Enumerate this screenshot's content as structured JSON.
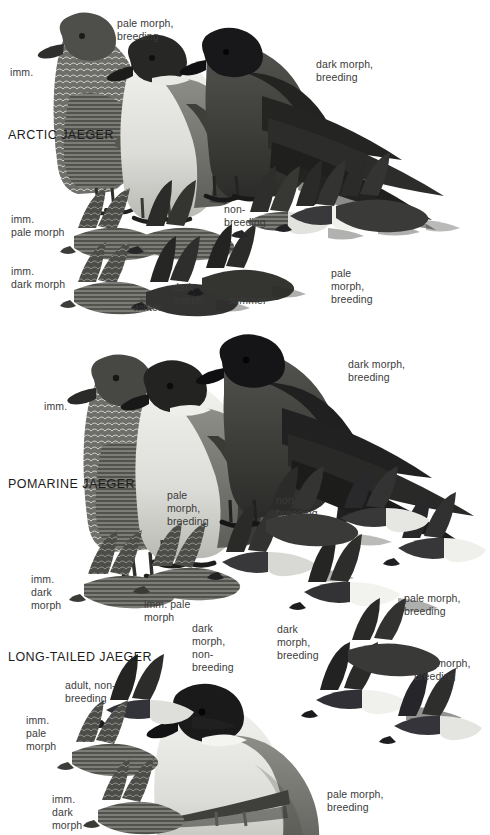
{
  "page": {
    "background": "#ffffff",
    "width": 490,
    "height": 835,
    "text_color": "#3b3b3b",
    "heading_color": "#1c1c1c"
  },
  "sections": [
    {
      "id": "arctic",
      "heading": "ARCTIC JAEGER",
      "heading_pos": {
        "x": 8,
        "y": 128
      },
      "labels": [
        {
          "name": "imm",
          "text": "imm.",
          "x": 10,
          "y": 66
        },
        {
          "name": "pale-morph-breeding",
          "text": "pale morph,\nbreeding",
          "x": 117,
          "y": 17
        },
        {
          "name": "dark-morph-breeding",
          "text": "dark morph,\nbreeding",
          "x": 316,
          "y": 58
        },
        {
          "name": "imm-pale-morph",
          "text": "imm.\npale morph",
          "x": 11,
          "y": 213
        },
        {
          "name": "imm-dark-morph",
          "text": "imm.\ndark morph",
          "x": 11,
          "y": 265
        },
        {
          "name": "winter",
          "text": "winter",
          "x": 133,
          "y": 301
        },
        {
          "name": "dark-morph",
          "text": "dark\nmorph",
          "x": 173,
          "y": 281
        },
        {
          "name": "summer",
          "text": "summer",
          "x": 228,
          "y": 294
        },
        {
          "name": "non-breeding",
          "text": "non-\nbreeding",
          "x": 224,
          "y": 203
        },
        {
          "name": "pale-morph-breeding-flight",
          "text": "pale\nmorph,\nbreeding",
          "x": 331,
          "y": 267
        }
      ]
    },
    {
      "id": "pomarine",
      "heading": "POMARINE JAEGER",
      "heading_pos": {
        "x": 8,
        "y": 477
      },
      "labels": [
        {
          "name": "imm",
          "text": "imm.",
          "x": 44,
          "y": 400
        },
        {
          "name": "pale-morph-breeding",
          "text": "pale\nmorph,\nbreeding",
          "x": 167,
          "y": 489
        },
        {
          "name": "dark-morph-breeding",
          "text": "dark morph,\nbreeding",
          "x": 348,
          "y": 358
        },
        {
          "name": "non-breeding",
          "text": "non-\nbreeding",
          "x": 276,
          "y": 494
        },
        {
          "name": "imm-dark-morph",
          "text": "imm.\ndark\nmorph",
          "x": 31,
          "y": 573
        },
        {
          "name": "imm-pale-morph",
          "text": "imm. pale\nmorph",
          "x": 144,
          "y": 598
        },
        {
          "name": "dark-morph-non-breeding",
          "text": "dark\nmorph,\nnon-\nbreeding",
          "x": 192,
          "y": 622
        },
        {
          "name": "dark-morph-breeding-flight",
          "text": "dark\nmorph,\nbreeding",
          "x": 277,
          "y": 623
        },
        {
          "name": "pale-morph-breeding-flight",
          "text": "pale morph,\nbreeding",
          "x": 404,
          "y": 592
        }
      ]
    },
    {
      "id": "long-tailed",
      "heading": "LONG-TAILED JAEGER",
      "heading_pos": {
        "x": 8,
        "y": 650
      },
      "labels": [
        {
          "name": "adult-non-breeding",
          "text": "adult, non-\nbreeding",
          "x": 65,
          "y": 679
        },
        {
          "name": "imm-pale-morph",
          "text": "imm.\npale\nmorph",
          "x": 26,
          "y": 714
        },
        {
          "name": "imm-dark-morph",
          "text": "imm.\ndark\nmorph",
          "x": 52,
          "y": 793
        },
        {
          "name": "pale-morph-breeding-right",
          "text": "pale morph,\nbreeding",
          "x": 414,
          "y": 657
        },
        {
          "name": "pale-morph-breeding-bottom",
          "text": "pale morph,\nbreeding",
          "x": 327,
          "y": 788
        }
      ]
    }
  ],
  "figures": [
    {
      "name": "arctic-standing-imm",
      "section": "arctic"
    },
    {
      "name": "arctic-standing-pale-morph-breeding",
      "section": "arctic"
    },
    {
      "name": "arctic-standing-dark-morph-breeding",
      "section": "arctic"
    },
    {
      "name": "arctic-flight-imm-pale-morph",
      "section": "arctic"
    },
    {
      "name": "arctic-flight-imm-dark-morph",
      "section": "arctic"
    },
    {
      "name": "arctic-flight-winter",
      "section": "arctic"
    },
    {
      "name": "arctic-flight-dark-morph",
      "section": "arctic"
    },
    {
      "name": "arctic-flight-summer",
      "section": "arctic"
    },
    {
      "name": "arctic-flight-non-breeding",
      "section": "arctic"
    },
    {
      "name": "arctic-flight-pale-morph-breeding",
      "section": "arctic"
    },
    {
      "name": "pomarine-standing-imm",
      "section": "pomarine"
    },
    {
      "name": "pomarine-standing-pale-morph-breeding",
      "section": "pomarine"
    },
    {
      "name": "pomarine-standing-dark-morph-breeding",
      "section": "pomarine"
    },
    {
      "name": "pomarine-flight-imm-dark-morph",
      "section": "pomarine"
    },
    {
      "name": "pomarine-flight-imm-pale-morph",
      "section": "pomarine"
    },
    {
      "name": "pomarine-flight-dark-morph-non-breeding",
      "section": "pomarine"
    },
    {
      "name": "pomarine-flight-dark-morph-breeding",
      "section": "pomarine"
    },
    {
      "name": "pomarine-flight-pale-morph-breeding",
      "section": "pomarine"
    },
    {
      "name": "long-tailed-standing-pale-morph-breeding",
      "section": "long-tailed"
    },
    {
      "name": "long-tailed-flight-adult-non-breeding",
      "section": "long-tailed"
    },
    {
      "name": "long-tailed-flight-imm-pale-morph",
      "section": "long-tailed"
    },
    {
      "name": "long-tailed-flight-imm-dark-morph",
      "section": "long-tailed"
    },
    {
      "name": "long-tailed-flight-pale-morph-breeding-a",
      "section": "long-tailed"
    },
    {
      "name": "long-tailed-flight-pale-morph-breeding-b",
      "section": "long-tailed"
    }
  ]
}
